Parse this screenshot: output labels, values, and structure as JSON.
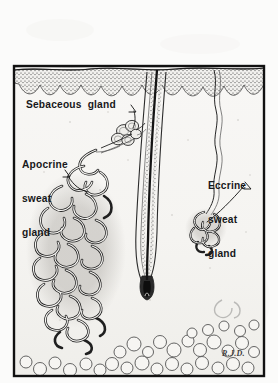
{
  "figure": {
    "medium": "halftone line drawing on paper",
    "signature": "R.J.D.",
    "background_color": "#fbfbfa",
    "ink_color": "#17181a",
    "frame": {
      "x": 14,
      "y": 66,
      "width": 250,
      "height": 310
    }
  },
  "labels": {
    "sebaceous": "Sebaceous  gland",
    "apocrine_line1": "Apocrine",
    "apocrine_line2": "sweat",
    "apocrine_line3": "gland",
    "eccrine_line1": "Eccrine",
    "eccrine_line2": "sweat",
    "eccrine_line3": "gland"
  },
  "structures": [
    {
      "name": "skin-surface",
      "description": "wavy epidermal surface line across top of plate"
    },
    {
      "name": "epidermis-band",
      "description": "stippled band with scalloped rete ridges along its lower edge"
    },
    {
      "name": "hair-shaft",
      "description": "thick dark diagonal hair emerging above the skin surface"
    },
    {
      "name": "hair-follicle",
      "description": "long oblique follicle canal ending in a dark hair bulb"
    },
    {
      "name": "sebaceous-gland",
      "description": "lobulated gland opening into the upper follicle"
    },
    {
      "name": "apocrine-sweat-gland",
      "description": "large tangled coil of secretory tubules in the lower dermis"
    },
    {
      "name": "apocrine-duct",
      "description": "duct running up from the apocrine coil to the follicle"
    },
    {
      "name": "eccrine-sweat-gland",
      "description": "small compact coil at lower right"
    },
    {
      "name": "eccrine-duct",
      "description": "wavy duct spiralling from the eccrine coil up to the skin surface"
    },
    {
      "name": "subcutaneous-fat",
      "description": "outlined round fat cells along the bottom of the plate"
    }
  ]
}
